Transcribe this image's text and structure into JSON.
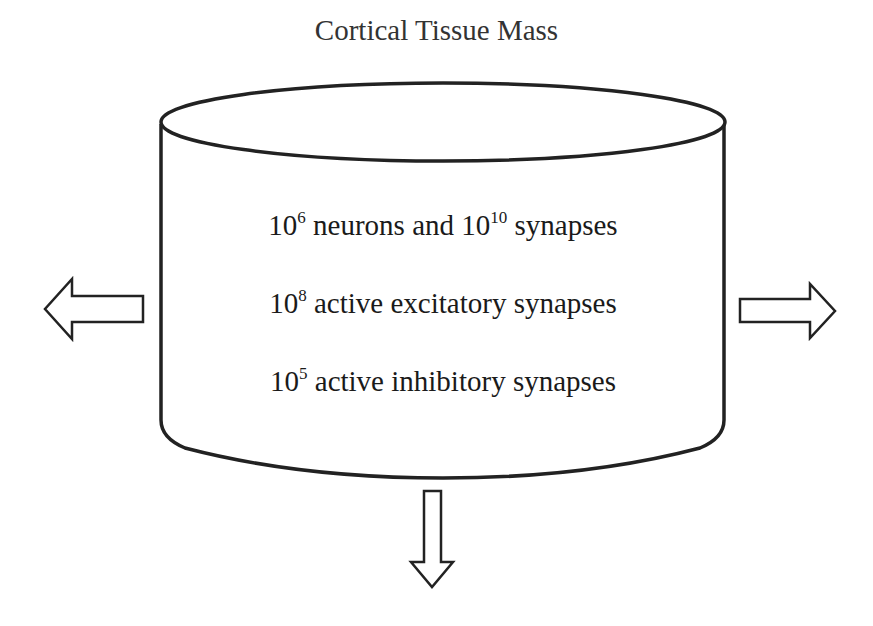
{
  "diagram": {
    "title": "Cortical Tissue Mass",
    "container_shape": "cylinder",
    "lines": [
      {
        "base": "10",
        "exp": "6",
        "text": " neurons and ",
        "base2": "10",
        "exp2": "10",
        "text2": " synapses"
      },
      {
        "base": "10",
        "exp": "8",
        "text": " active excitatory synapses"
      },
      {
        "base": "10",
        "exp": "5",
        "text": " active inhibitory synapses"
      }
    ],
    "arrows": [
      {
        "direction": "left",
        "style": "hollow"
      },
      {
        "direction": "right",
        "style": "hollow"
      },
      {
        "direction": "down",
        "style": "hollow"
      }
    ],
    "colors": {
      "stroke": "#222222",
      "background": "#ffffff",
      "text": "#1a1a1a"
    }
  }
}
